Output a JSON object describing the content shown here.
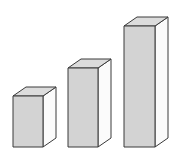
{
  "chart_data": {
    "type": "bar",
    "title": "",
    "subtitle": "",
    "xlabel": "",
    "ylabel": "",
    "categories": [
      "1",
      "2",
      "3"
    ],
    "values": [
      51,
      79,
      121
    ],
    "tick_labels": [],
    "legend": [],
    "legend_position": "none",
    "grid": false,
    "axis_visible": false,
    "ylim": [
      0,
      130
    ],
    "annotations": [],
    "style": "3d-isometric-blocks",
    "series": [
      {
        "name": "bars",
        "values": [
          51,
          79,
          121
        ]
      }
    ],
    "bars": [
      {
        "name": "bar-1",
        "value": 51,
        "front_x": 13,
        "front_right_x": 43,
        "front_top_y": 96,
        "baseline_y": 147
      },
      {
        "name": "bar-2",
        "value": 79,
        "front_x": 68,
        "front_right_x": 98,
        "front_top_y": 68,
        "baseline_y": 147
      },
      {
        "name": "bar-3",
        "value": 121,
        "front_x": 124,
        "front_right_x": 155,
        "front_top_y": 26,
        "baseline_y": 147
      }
    ],
    "depth": {
      "dx": 13,
      "dy": -9
    },
    "colors": {
      "background": "#ffffff",
      "front_face": "#d3d3d3",
      "top_face": "#dcdcdc",
      "side_face": "#fbfbfb",
      "outline": "#3a3a3a"
    }
  },
  "figure": {
    "width": 180,
    "height": 165,
    "caption": ""
  }
}
